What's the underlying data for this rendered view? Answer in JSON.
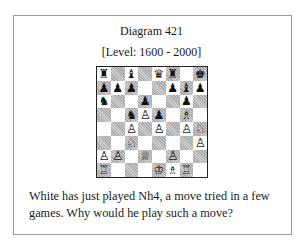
{
  "diagram": {
    "title": "Diagram 421",
    "level": "[Level: 1600 - 2000]",
    "question": "White has just played Nh4, a move tried in a few games. Why would he play such a move?"
  },
  "board": {
    "orientation": "white-bottom",
    "ranks": [
      [
        "r",
        "",
        "b",
        "",
        "q",
        "r",
        "",
        "k"
      ],
      [
        "p",
        "p",
        "p",
        "",
        "",
        "p",
        "b",
        "p"
      ],
      [
        "n",
        "",
        "",
        "p",
        "",
        "",
        "p",
        ""
      ],
      [
        "",
        "",
        "n",
        "P",
        "p",
        "",
        "B",
        ""
      ],
      [
        "",
        "",
        "P",
        "",
        "P",
        "",
        "P",
        "N"
      ],
      [
        "",
        "",
        "N",
        "",
        "",
        "",
        "",
        "P"
      ],
      [
        "P",
        "P",
        "",
        "Q",
        "",
        "P",
        "",
        ""
      ],
      [
        "R",
        "",
        "",
        "",
        "K",
        "B",
        "R",
        ""
      ]
    ],
    "glyphs": {
      "K": "♔",
      "Q": "♕",
      "R": "♖",
      "B": "♗",
      "N": "♘",
      "P": "♙",
      "k": "♚",
      "q": "♛",
      "r": "♜",
      "b": "♝",
      "n": "♞",
      "p": "♟"
    }
  }
}
